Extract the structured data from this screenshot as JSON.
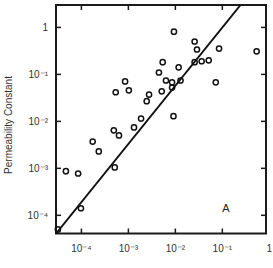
{
  "chart_data": {
    "type": "scatter",
    "title": "",
    "xlabel": "",
    "ylabel": "Permeability Constant",
    "xscale": "log",
    "yscale": "log",
    "xlim": [
      2.88e-05,
      0.85
    ],
    "ylim": [
      4.1e-05,
      3.0
    ],
    "grid": false,
    "legend": null,
    "annotation": "A",
    "x_ticks": [
      {
        "value": 0.0001,
        "label": "10⁻⁴"
      },
      {
        "value": 0.001,
        "label": "10⁻³"
      },
      {
        "value": 0.01,
        "label": "10⁻²"
      },
      {
        "value": 0.1,
        "label": "10⁻¹"
      },
      {
        "value": 1,
        "label": "1"
      }
    ],
    "y_ticks": [
      {
        "value": 1,
        "label": "1"
      },
      {
        "value": 0.1,
        "label": "10⁻¹"
      },
      {
        "value": 0.01,
        "label": "10⁻²"
      },
      {
        "value": 0.001,
        "label": "10⁻³"
      },
      {
        "value": 0.0001,
        "label": "10⁻⁴"
      }
    ],
    "series": [
      {
        "name": "measurements",
        "marker": "open-circle",
        "log10_points": [
          [
            -4.5,
            -4.3
          ],
          [
            -4.33,
            -3.06
          ],
          [
            -4.07,
            -3.11
          ],
          [
            -4.01,
            -3.85
          ],
          [
            -3.76,
            -2.43
          ],
          [
            -3.63,
            -2.64
          ],
          [
            -3.31,
            -2.19
          ],
          [
            -3.2,
            -2.3
          ],
          [
            -3.29,
            -2.98
          ],
          [
            -3.27,
            -1.38
          ],
          [
            -3.07,
            -1.15
          ],
          [
            -2.99,
            -1.34
          ],
          [
            -2.88,
            -2.13
          ],
          [
            -2.73,
            -1.94
          ],
          [
            -2.61,
            -1.57
          ],
          [
            -2.56,
            -1.43
          ],
          [
            -2.35,
            -0.96
          ],
          [
            -2.27,
            -0.74
          ],
          [
            -2.29,
            -1.36
          ],
          [
            -2.2,
            -1.13
          ],
          [
            -2.07,
            -1.17
          ],
          [
            -2.07,
            -1.28
          ],
          [
            -2.03,
            -0.09
          ],
          [
            -1.93,
            -0.85
          ],
          [
            -1.89,
            -1.13
          ],
          [
            -2.04,
            -1.89
          ],
          [
            -1.59,
            -0.3
          ],
          [
            -1.54,
            -0.47
          ],
          [
            -1.59,
            -0.74
          ],
          [
            -1.44,
            -0.72
          ],
          [
            -1.29,
            -0.7
          ],
          [
            -1.07,
            -0.45
          ],
          [
            -1.14,
            -1.17
          ],
          [
            -0.27,
            -0.51
          ]
        ]
      }
    ],
    "fit_line": {
      "name": "regression",
      "log10_start": [
        -4.54,
        -4.39
      ],
      "log10_end": [
        -0.62,
        0.47
      ]
    }
  }
}
